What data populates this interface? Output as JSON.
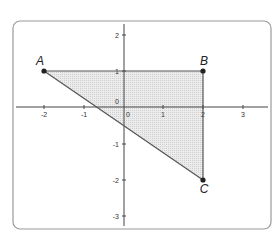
{
  "figure": {
    "type": "coordinate-plane-triangle",
    "x_ticks": [
      {
        "value": -2,
        "label": "-2"
      },
      {
        "value": -1,
        "label": "-1"
      },
      {
        "value": 0,
        "label": "0"
      },
      {
        "value": 1,
        "label": "1"
      },
      {
        "value": 2,
        "label": "2"
      },
      {
        "value": 3,
        "label": "3"
      }
    ],
    "y_ticks": [
      {
        "value": 2,
        "label": "2"
      },
      {
        "value": 1,
        "label": "1"
      },
      {
        "value": 0,
        "label": "0"
      },
      {
        "value": -1,
        "label": "-1"
      },
      {
        "value": -2,
        "label": "-2"
      },
      {
        "value": -3,
        "label": "-3"
      }
    ],
    "points": [
      {
        "name": "A",
        "x": -2,
        "y": 1
      },
      {
        "name": "B",
        "x": 2,
        "y": 1
      },
      {
        "name": "C",
        "x": 2,
        "y": -2
      }
    ],
    "labels": {
      "A": "A",
      "B": "B",
      "C": "C"
    },
    "shaded_region": "triangle ABC",
    "colors": {
      "fill": "#e3e3e3",
      "stroke": "#555555",
      "frame": "#9a9a9a",
      "point": "#222222"
    }
  }
}
